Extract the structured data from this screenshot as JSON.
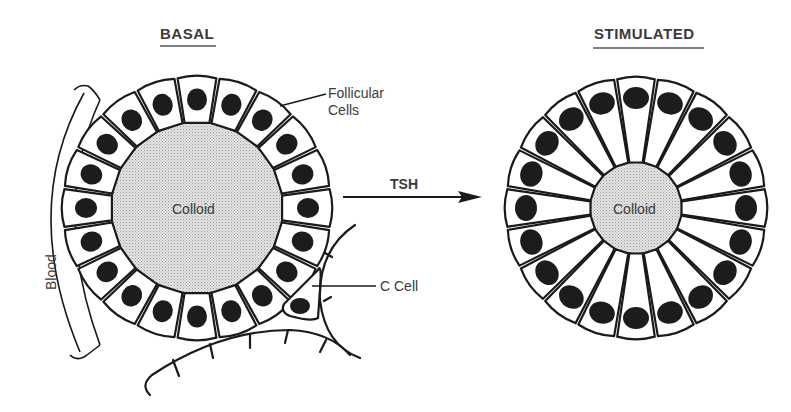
{
  "titles": {
    "basal": "BASAL",
    "stimulated": "STIMULATED"
  },
  "labels": {
    "follicular_cells_line1": "Follicular",
    "follicular_cells_line2": "Cells",
    "colloid_basal": "Colloid",
    "colloid_stimulated": "Colloid",
    "blood": "Blood",
    "c_cell": "C Cell",
    "arrow": "TSH"
  },
  "follicles": {
    "basal": {
      "cx": 197,
      "cy": 208,
      "outer_rx": 134,
      "outer_ry": 131,
      "inner_r": 84,
      "cell_count": 20
    },
    "stimulated": {
      "cx": 636,
      "cy": 208,
      "outer_rx": 130,
      "outer_ry": 130,
      "inner_r": 44,
      "cell_count": 20
    }
  },
  "colors": {
    "ink": "#1a1a1a",
    "text": "#3a3a3a",
    "colloid_fill": "#d9d9d9",
    "background": "#ffffff"
  }
}
